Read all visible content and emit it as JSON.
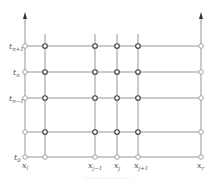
{
  "diagram": {
    "type": "finite-difference-grid",
    "colors": {
      "line": "#8a8a8a",
      "boundary_node": "#9a9a9a",
      "interior_node": "#3a3a3a",
      "label": "#555555",
      "caption": "#c8c8c8"
    },
    "y_labels": [
      {
        "base": "t",
        "sub": "n+1",
        "y": 46
      },
      {
        "base": "t",
        "sub": "n",
        "y": 72
      },
      {
        "base": "t",
        "sub": "n−1",
        "y": 98
      },
      {
        "base": "",
        "sub": "",
        "y": 132
      },
      {
        "base": "t",
        "sub": "0",
        "y": 157
      }
    ],
    "x_labels": [
      {
        "base": "x",
        "sub": "l",
        "x": 25
      },
      {
        "base": "x",
        "sub": "j−1",
        "x": 95
      },
      {
        "base": "x",
        "sub": "j",
        "x": 117
      },
      {
        "base": "x",
        "sub": "j+1",
        "x": 138
      },
      {
        "base": "x",
        "sub": "r",
        "x": 201
      }
    ],
    "interior_x": [
      45,
      95,
      117,
      138
    ],
    "caption": "······ ·········· ·······"
  }
}
